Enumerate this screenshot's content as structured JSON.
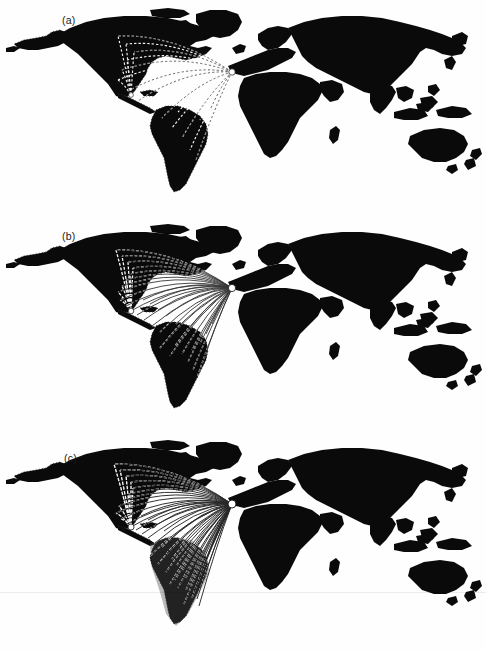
{
  "figure": {
    "kind": "scanned-figure",
    "background_color": "#fefefe",
    "land_color": "#0a0a0a",
    "flow_color_light": "#ffffff",
    "flow_color_dark": "#111111",
    "coastline_stipple_color": "#3a3a3a",
    "width": 486,
    "height": 650,
    "panel_count": 3
  },
  "panels": [
    {
      "id": "a",
      "label": "(a)",
      "label_x": 62,
      "label_y": 14,
      "top": 0,
      "height": 216,
      "flow_count": 18,
      "flow_style": "dashed-light",
      "density": "sparse",
      "hub": {
        "name": "iberia-hub",
        "x": 232,
        "y": 72
      },
      "secondary_hub": {
        "name": "caribbean-node",
        "x": 131,
        "y": 95
      },
      "destinations": [
        {
          "x": 118,
          "y": 36
        },
        {
          "x": 126,
          "y": 44
        },
        {
          "x": 134,
          "y": 52
        },
        {
          "x": 127,
          "y": 60
        },
        {
          "x": 122,
          "y": 70
        },
        {
          "x": 118,
          "y": 80
        },
        {
          "x": 126,
          "y": 92
        },
        {
          "x": 131,
          "y": 95
        },
        {
          "x": 138,
          "y": 101
        },
        {
          "x": 150,
          "y": 108
        },
        {
          "x": 162,
          "y": 118
        },
        {
          "x": 172,
          "y": 128
        },
        {
          "x": 182,
          "y": 138
        },
        {
          "x": 190,
          "y": 150
        },
        {
          "x": 196,
          "y": 160
        },
        {
          "x": 200,
          "y": 120
        },
        {
          "x": 210,
          "y": 110
        },
        {
          "x": 178,
          "y": 112
        }
      ]
    },
    {
      "id": "b",
      "label": "(b)",
      "label_x": 62,
      "label_y": 14,
      "top": 216,
      "height": 216,
      "flow_count": 34,
      "flow_style": "mixed-solid-dashed",
      "density": "medium",
      "hub": {
        "name": "iberia-hub",
        "x": 232,
        "y": 72
      },
      "secondary_hub": {
        "name": "caribbean-node",
        "x": 131,
        "y": 95
      },
      "destinations": [
        {
          "x": 116,
          "y": 34
        },
        {
          "x": 122,
          "y": 40
        },
        {
          "x": 128,
          "y": 46
        },
        {
          "x": 133,
          "y": 52
        },
        {
          "x": 130,
          "y": 58
        },
        {
          "x": 126,
          "y": 64
        },
        {
          "x": 122,
          "y": 70
        },
        {
          "x": 118,
          "y": 76
        },
        {
          "x": 120,
          "y": 84
        },
        {
          "x": 126,
          "y": 90
        },
        {
          "x": 131,
          "y": 95
        },
        {
          "x": 137,
          "y": 99
        },
        {
          "x": 144,
          "y": 104
        },
        {
          "x": 152,
          "y": 110
        },
        {
          "x": 160,
          "y": 116
        },
        {
          "x": 168,
          "y": 122
        },
        {
          "x": 175,
          "y": 130
        },
        {
          "x": 182,
          "y": 138
        },
        {
          "x": 188,
          "y": 146
        },
        {
          "x": 193,
          "y": 154
        },
        {
          "x": 197,
          "y": 162
        },
        {
          "x": 200,
          "y": 128
        },
        {
          "x": 206,
          "y": 118
        },
        {
          "x": 212,
          "y": 108
        },
        {
          "x": 185,
          "y": 118
        },
        {
          "x": 176,
          "y": 108
        },
        {
          "x": 166,
          "y": 100
        },
        {
          "x": 158,
          "y": 94
        },
        {
          "x": 150,
          "y": 88
        },
        {
          "x": 143,
          "y": 84
        },
        {
          "x": 192,
          "y": 134
        },
        {
          "x": 203,
          "y": 146
        },
        {
          "x": 170,
          "y": 140
        },
        {
          "x": 160,
          "y": 132
        }
      ]
    },
    {
      "id": "c",
      "label": "(c)",
      "label_x": 64,
      "label_y": 20,
      "top": 432,
      "height": 216,
      "flow_count": 48,
      "flow_style": "dense-solid",
      "density": "dense",
      "hub": {
        "name": "iberia-hub",
        "x": 232,
        "y": 72
      },
      "secondary_hub": {
        "name": "caribbean-node",
        "x": 131,
        "y": 95
      },
      "shaded_region": {
        "name": "south-america-shade",
        "opacity": 0.35
      },
      "destinations": [
        {
          "x": 114,
          "y": 32
        },
        {
          "x": 120,
          "y": 38
        },
        {
          "x": 126,
          "y": 44
        },
        {
          "x": 131,
          "y": 50
        },
        {
          "x": 133,
          "y": 56
        },
        {
          "x": 129,
          "y": 62
        },
        {
          "x": 124,
          "y": 68
        },
        {
          "x": 119,
          "y": 74
        },
        {
          "x": 116,
          "y": 81
        },
        {
          "x": 121,
          "y": 87
        },
        {
          "x": 127,
          "y": 92
        },
        {
          "x": 131,
          "y": 95
        },
        {
          "x": 136,
          "y": 98
        },
        {
          "x": 142,
          "y": 102
        },
        {
          "x": 148,
          "y": 106
        },
        {
          "x": 155,
          "y": 111
        },
        {
          "x": 161,
          "y": 116
        },
        {
          "x": 167,
          "y": 121
        },
        {
          "x": 172,
          "y": 127
        },
        {
          "x": 177,
          "y": 133
        },
        {
          "x": 182,
          "y": 139
        },
        {
          "x": 186,
          "y": 146
        },
        {
          "x": 190,
          "y": 153
        },
        {
          "x": 194,
          "y": 160
        },
        {
          "x": 197,
          "y": 167
        },
        {
          "x": 199,
          "y": 174
        },
        {
          "x": 201,
          "y": 140
        },
        {
          "x": 205,
          "y": 130
        },
        {
          "x": 209,
          "y": 120
        },
        {
          "x": 214,
          "y": 110
        },
        {
          "x": 188,
          "y": 122
        },
        {
          "x": 180,
          "y": 114
        },
        {
          "x": 172,
          "y": 106
        },
        {
          "x": 164,
          "y": 99
        },
        {
          "x": 156,
          "y": 93
        },
        {
          "x": 148,
          "y": 88
        },
        {
          "x": 141,
          "y": 84
        },
        {
          "x": 195,
          "y": 136
        },
        {
          "x": 202,
          "y": 152
        },
        {
          "x": 175,
          "y": 148
        },
        {
          "x": 166,
          "y": 140
        },
        {
          "x": 158,
          "y": 132
        },
        {
          "x": 150,
          "y": 124
        },
        {
          "x": 192,
          "y": 166
        },
        {
          "x": 186,
          "y": 158
        },
        {
          "x": 178,
          "y": 156
        },
        {
          "x": 170,
          "y": 152
        },
        {
          "x": 184,
          "y": 172
        }
      ]
    }
  ],
  "artifacts": {
    "scanline_y": 592,
    "scanline_label": "scan-artifact-line"
  }
}
